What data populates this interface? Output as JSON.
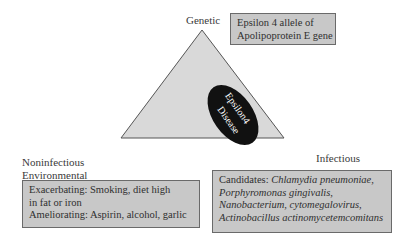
{
  "diagram": {
    "center": {
      "line1": "Epsilon4",
      "line2": "Disease"
    },
    "vertices": {
      "top": "Genetic",
      "bottom_left_line1": "Noninfectious",
      "bottom_left_line2": "Environmental",
      "bottom_right": "Infectious"
    },
    "boxes": {
      "genetic": {
        "line1": "Epsilon 4 allele of",
        "line2": "Apolipoprotein E gene"
      },
      "environmental": {
        "line1": "Exacerbating: Smoking, diet high",
        "line2": "in fat or iron",
        "line3": "Ameliorating: Aspirin, alcohol, garlic"
      },
      "infectious": {
        "prefix": "Candidates: ",
        "line1_italic": "Chlamydia pneumoniae,",
        "line2_italic": "Porphyromonas gingivalis,",
        "line3_italic": "Nanobacterium,",
        "line3_normal": " cytomegalovirus,",
        "line4_italic": "Actinobacillus actinomycetemcomitans"
      }
    },
    "colors": {
      "triangle_fill": "#d9d9d9",
      "triangle_stroke": "#555555",
      "ellipse_fill": "#111111",
      "box_fill": "#c8c8c8"
    }
  }
}
